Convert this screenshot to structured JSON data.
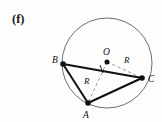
{
  "figure": {
    "panel_label": "(f)",
    "colors": {
      "background": "#fdfdfb",
      "circle_stroke": "#6e6e6e",
      "chord_stroke": "#111111",
      "dashed_stroke": "#8c8c8c",
      "point_fill": "#111111",
      "text": "#111111"
    },
    "circle": {
      "cx": 107,
      "cy": 63,
      "r": 45,
      "stroke_width": 1.0
    },
    "center_point": {
      "label": "O",
      "x": 107,
      "y": 62,
      "dot_r": 2.4,
      "label_x": 104,
      "label_y": 54
    },
    "vertices": [
      {
        "label": "B",
        "x": 63,
        "y": 64,
        "dot_r": 2.6,
        "label_x": 52,
        "label_y": 63
      },
      {
        "label": "C",
        "x": 142,
        "y": 78,
        "dot_r": 2.6,
        "label_x": 148,
        "label_y": 82
      },
      {
        "label": "A",
        "x": 88,
        "y": 103,
        "dot_r": 2.6,
        "label_x": 83,
        "label_y": 117
      }
    ],
    "chords": [
      {
        "name": "chord-bc",
        "x1": 63,
        "y1": 64,
        "x2": 142,
        "y2": 78
      },
      {
        "name": "chord-ba",
        "x1": 63,
        "y1": 64,
        "x2": 88,
        "y2": 103
      },
      {
        "name": "chord-ac",
        "x1": 88,
        "y1": 103,
        "x2": 142,
        "y2": 78
      }
    ],
    "radii": [
      {
        "name": "radius-oc",
        "label": "R",
        "x1": 107,
        "y1": 62,
        "x2": 142,
        "y2": 78,
        "label_x": 125,
        "label_y": 62
      },
      {
        "name": "radius-oa",
        "label": "R",
        "x1": 107,
        "y1": 62,
        "x2": 88,
        "y2": 103,
        "label_x": 85,
        "label_y": 83
      }
    ],
    "tick_marks": [
      {
        "name": "tick-bc",
        "x1": 100,
        "y1": 66,
        "x2": 103,
        "y2": 73
      }
    ]
  }
}
